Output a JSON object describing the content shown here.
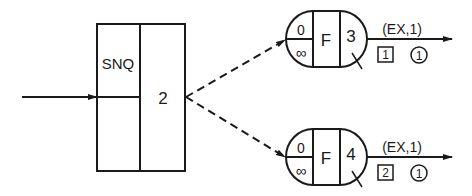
{
  "diagram": {
    "main_block": {
      "label": "SNQ",
      "number": "2"
    },
    "nodes": [
      {
        "top_value": "0",
        "bottom_value": "∞",
        "middle_label": "F",
        "right_label": "3",
        "output_label": "(EX,1)",
        "box_value": "1",
        "circle_value": "1"
      },
      {
        "top_value": "0",
        "bottom_value": "∞",
        "middle_label": "F",
        "right_label": "4",
        "output_label": "(EX,1)",
        "box_value": "2",
        "circle_value": "1"
      }
    ],
    "colors": {
      "stroke": "#1a1a1a",
      "background": "#ffffff"
    }
  }
}
